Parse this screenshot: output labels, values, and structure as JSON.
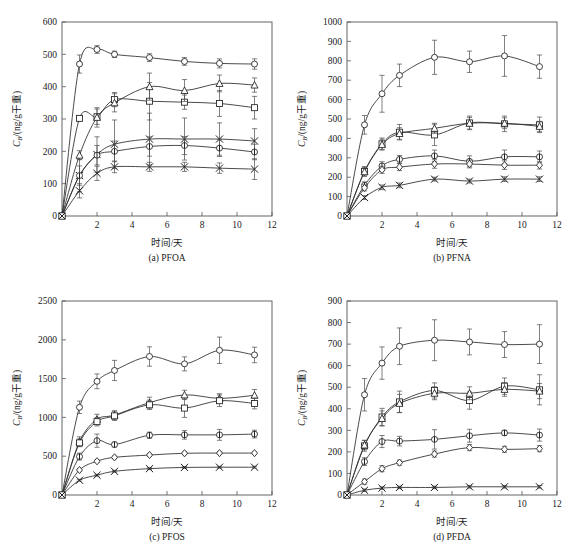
{
  "figure": {
    "name": "four-panel-uptake-kinetics",
    "axis": {
      "xlabel": "时间/天",
      "ylabel_main": "C",
      "ylabel_sub": "B",
      "ylabel_unit": "/(ng/g干重)"
    }
  },
  "chart_data": [
    {
      "type": "line",
      "panel": "a",
      "title": "(a) PFOA",
      "xlabel": "时间/天",
      "ylabel": "C_B/(ng/g干重)",
      "xlim": [
        0,
        12
      ],
      "ylim": [
        0,
        600
      ],
      "xticks": [
        0,
        2,
        4,
        6,
        8,
        10,
        12
      ],
      "yticks": [
        0,
        100,
        200,
        300,
        400,
        500,
        600
      ],
      "grid": false,
      "legend": "none",
      "x": [
        0,
        1,
        2,
        3,
        5,
        7,
        9,
        11
      ],
      "series": [
        {
          "name": "S1",
          "marker": "circle",
          "values": [
            0,
            470,
            515,
            500,
            490,
            478,
            472,
            470
          ],
          "errors": [
            0,
            28,
            12,
            10,
            12,
            12,
            14,
            16
          ]
        },
        {
          "name": "S2",
          "marker": "square",
          "values": [
            0,
            302,
            307,
            360,
            355,
            352,
            348,
            335
          ],
          "errors": [
            0,
            8,
            24,
            22,
            58,
            22,
            40,
            35
          ]
        },
        {
          "name": "S3",
          "marker": "triangle",
          "values": [
            0,
            188,
            305,
            350,
            400,
            388,
            410,
            405
          ],
          "errors": [
            0,
            14,
            30,
            28,
            42,
            34,
            26,
            22
          ]
        },
        {
          "name": "S4",
          "marker": "xmark",
          "values": [
            0,
            125,
            190,
            222,
            238,
            238,
            238,
            232
          ],
          "errors": [
            0,
            50,
            55,
            75,
            80,
            65,
            50,
            38
          ]
        },
        {
          "name": "S5",
          "marker": "circle2",
          "values": [
            0,
            125,
            188,
            200,
            215,
            218,
            210,
            198
          ],
          "errors": [
            0,
            30,
            30,
            32,
            30,
            28,
            26,
            24
          ]
        },
        {
          "name": "S6",
          "marker": "xmark2",
          "values": [
            0,
            78,
            132,
            152,
            152,
            152,
            148,
            145
          ],
          "errors": [
            0,
            22,
            22,
            18,
            14,
            14,
            16,
            32
          ]
        }
      ]
    },
    {
      "type": "line",
      "panel": "b",
      "title": "(b) PFNA",
      "xlabel": "时间/天",
      "ylabel": "C_B/(ng/g干重)",
      "xlim": [
        0,
        12
      ],
      "ylim": [
        0,
        1000
      ],
      "xticks": [
        0,
        2,
        4,
        6,
        8,
        10,
        12
      ],
      "yticks": [
        0,
        100,
        200,
        300,
        400,
        500,
        600,
        700,
        800,
        900,
        1000
      ],
      "grid": false,
      "legend": "none",
      "x": [
        0,
        1,
        2,
        3,
        5,
        7,
        9,
        11
      ],
      "series": [
        {
          "name": "S1",
          "marker": "circle",
          "values": [
            0,
            470,
            630,
            725,
            818,
            795,
            825,
            770
          ],
          "errors": [
            0,
            48,
            95,
            58,
            88,
            55,
            105,
            60
          ]
        },
        {
          "name": "S2",
          "marker": "square",
          "values": [
            0,
            230,
            372,
            432,
            418,
            480,
            475,
            470
          ],
          "errors": [
            0,
            25,
            30,
            40,
            55,
            35,
            40,
            40
          ]
        },
        {
          "name": "S3",
          "marker": "triangle",
          "values": [
            0,
            228,
            368,
            425,
            452,
            478,
            478,
            462
          ],
          "errors": [
            0,
            22,
            28,
            30,
            26,
            30,
            28,
            26
          ]
        },
        {
          "name": "S4",
          "marker": "circle2",
          "values": [
            0,
            158,
            258,
            292,
            310,
            282,
            305,
            305
          ],
          "errors": [
            0,
            18,
            22,
            20,
            30,
            28,
            35,
            30
          ]
        },
        {
          "name": "S5",
          "marker": "diamond",
          "values": [
            0,
            145,
            238,
            252,
            268,
            268,
            262,
            262
          ],
          "errors": [
            0,
            16,
            18,
            18,
            22,
            20,
            22,
            20
          ]
        },
        {
          "name": "S6",
          "marker": "xmark",
          "values": [
            0,
            95,
            148,
            158,
            190,
            180,
            190,
            190
          ],
          "errors": [
            0,
            10,
            12,
            12,
            10,
            10,
            12,
            12
          ]
        }
      ]
    },
    {
      "type": "line",
      "panel": "c",
      "title": "(c) PFOS",
      "xlabel": "时间/天",
      "ylabel": "C_B/(ng/g干重)",
      "xlim": [
        0,
        12
      ],
      "ylim": [
        0,
        2500
      ],
      "xticks": [
        0,
        2,
        4,
        6,
        8,
        10,
        12
      ],
      "yticks": [
        0,
        500,
        1000,
        1500,
        2000,
        2500
      ],
      "grid": false,
      "legend": "none",
      "x": [
        0,
        1,
        2,
        3,
        5,
        7,
        9,
        11
      ],
      "series": [
        {
          "name": "S1",
          "marker": "circle",
          "values": [
            0,
            1130,
            1465,
            1605,
            1785,
            1690,
            1865,
            1805
          ],
          "errors": [
            0,
            80,
            95,
            130,
            125,
            90,
            170,
            100
          ]
        },
        {
          "name": "S2",
          "marker": "triangle",
          "values": [
            0,
            690,
            975,
            1030,
            1190,
            1290,
            1245,
            1285
          ],
          "errors": [
            0,
            60,
            65,
            55,
            70,
            60,
            60,
            75
          ]
        },
        {
          "name": "S3",
          "marker": "square",
          "values": [
            0,
            672,
            945,
            1020,
            1162,
            1120,
            1215,
            1180
          ],
          "errors": [
            0,
            50,
            55,
            60,
            60,
            120,
            75,
            70
          ]
        },
        {
          "name": "S4",
          "marker": "circle2",
          "values": [
            0,
            495,
            700,
            650,
            770,
            775,
            775,
            785
          ],
          "errors": [
            0,
            45,
            85,
            30,
            40,
            55,
            70,
            50
          ]
        },
        {
          "name": "S5",
          "marker": "diamond",
          "values": [
            0,
            322,
            435,
            485,
            515,
            538,
            540,
            540
          ],
          "errors": [
            0,
            18,
            16,
            18,
            18,
            18,
            18,
            18
          ]
        },
        {
          "name": "S6",
          "marker": "xmark",
          "values": [
            0,
            190,
            255,
            305,
            340,
            355,
            358,
            358
          ],
          "errors": [
            0,
            12,
            12,
            12,
            12,
            12,
            12,
            12
          ]
        }
      ]
    },
    {
      "type": "line",
      "panel": "d",
      "title": "(d) PFDA",
      "xlabel": "时间/天",
      "ylabel": "C_B/(ng/g干重)",
      "xlim": [
        0,
        12
      ],
      "ylim": [
        0,
        900
      ],
      "xticks": [
        0,
        2,
        4,
        6,
        8,
        10,
        12
      ],
      "yticks": [
        0,
        100,
        200,
        300,
        400,
        500,
        600,
        700,
        800,
        900
      ],
      "grid": false,
      "legend": "none",
      "x": [
        0,
        1,
        2,
        3,
        5,
        7,
        9,
        11
      ],
      "series": [
        {
          "name": "S1",
          "marker": "circle",
          "values": [
            0,
            465,
            612,
            690,
            718,
            710,
            698,
            700
          ],
          "errors": [
            0,
            75,
            75,
            85,
            95,
            60,
            60,
            90
          ]
        },
        {
          "name": "S2",
          "marker": "square",
          "values": [
            0,
            228,
            362,
            432,
            485,
            438,
            505,
            488
          ],
          "errors": [
            0,
            25,
            40,
            50,
            35,
            40,
            38,
            70
          ]
        },
        {
          "name": "S3",
          "marker": "triangle",
          "values": [
            0,
            232,
            355,
            425,
            472,
            472,
            490,
            482
          ],
          "errors": [
            0,
            22,
            35,
            42,
            30,
            30,
            32,
            35
          ]
        },
        {
          "name": "S4",
          "marker": "circle2",
          "values": [
            0,
            155,
            248,
            250,
            258,
            275,
            288,
            278
          ],
          "errors": [
            0,
            18,
            28,
            22,
            45,
            30,
            12,
            28
          ]
        },
        {
          "name": "S5",
          "marker": "diamond",
          "values": [
            0,
            62,
            122,
            150,
            190,
            220,
            212,
            215
          ],
          "errors": [
            0,
            12,
            14,
            12,
            14,
            14,
            14,
            14
          ]
        },
        {
          "name": "S6",
          "marker": "xmark",
          "values": [
            0,
            22,
            32,
            35,
            35,
            38,
            38,
            38
          ],
          "errors": [
            0,
            6,
            6,
            6,
            6,
            6,
            6,
            6
          ]
        }
      ]
    }
  ]
}
